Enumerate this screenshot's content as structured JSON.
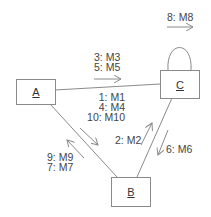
{
  "diagram": {
    "type": "collaboration-diagram",
    "objects": [
      {
        "id": "A",
        "label": "A"
      },
      {
        "id": "B",
        "label": "B"
      },
      {
        "id": "C",
        "label": "C"
      }
    ],
    "links": [
      {
        "from": "A",
        "to": "C"
      },
      {
        "from": "A",
        "to": "B"
      },
      {
        "from": "C",
        "to": "B"
      },
      {
        "from": "C",
        "to": "C",
        "self_loop": true
      }
    ],
    "messages": {
      "a_to_c": [
        "3: M3",
        "5: M5"
      ],
      "c_self": [
        "8: M8"
      ],
      "a_to_b": [
        "1: M1",
        "4: M4",
        "10: M10"
      ],
      "b_to_c": [
        "2: M2"
      ],
      "c_to_b": [
        "6: M6"
      ],
      "b_to_a": [
        "9: M9",
        "7: M7"
      ]
    },
    "colors": {
      "line": "#8a8a8a",
      "text": "#444444"
    }
  }
}
